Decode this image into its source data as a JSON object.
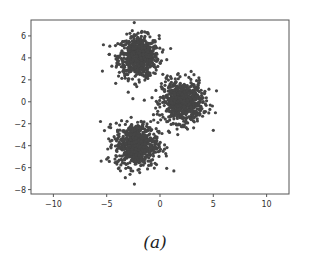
{
  "caption": "(a)",
  "colors": {
    "points": "#454545",
    "axes": "#555555",
    "tick_labels": "#333333",
    "background": "#ffffff"
  },
  "chart_data": {
    "type": "scatter",
    "title": "",
    "xlabel": "",
    "ylabel": "",
    "xlim": [
      -12.1,
      12.1
    ],
    "ylim": [
      -8.4,
      7.45
    ],
    "xticks": [
      -10,
      -5,
      0,
      5,
      10
    ],
    "xtick_labels": [
      "−10",
      "−5",
      "0",
      "5",
      "10"
    ],
    "yticks": [
      -8,
      -6,
      -4,
      -2,
      0,
      2,
      4,
      6
    ],
    "ytick_labels": [
      "−8",
      "−6",
      "−4",
      "−2",
      "0",
      "2",
      "4",
      "6"
    ],
    "grid": false,
    "legend": null,
    "series": [
      {
        "name": "cluster-1",
        "center": [
          -2.0,
          4.1
        ],
        "std": 0.95,
        "n": 700
      },
      {
        "name": "cluster-2",
        "center": [
          2.1,
          0.0
        ],
        "std": 0.95,
        "n": 700
      },
      {
        "name": "cluster-3",
        "center": [
          -2.2,
          -3.9
        ],
        "std": 1.0,
        "n": 700
      }
    ],
    "outliers": [
      [
        5.0,
        -2.6
      ],
      [
        1.3,
        -6.3
      ],
      [
        -2.4,
        -7.5
      ],
      [
        5.3,
        1.0
      ],
      [
        -5.4,
        2.8
      ],
      [
        -4.9,
        -4.3
      ],
      [
        5.2,
        -1.0
      ]
    ],
    "marker_size_px": 3.2
  }
}
